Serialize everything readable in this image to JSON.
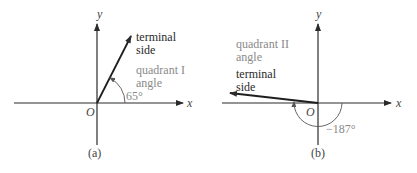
{
  "panel_a": {
    "caption": "(a)",
    "x_label": "x",
    "y_label": "y",
    "origin_label": "O",
    "terminal_label_line1": "terminal",
    "terminal_label_line2": "side",
    "quadrant_label_line1": "quadrant I",
    "quadrant_label_line2": "angle",
    "angle_label": "65°",
    "angle_degrees": 65
  },
  "panel_b": {
    "caption": "(b)",
    "x_label": "x",
    "y_label": "y",
    "origin_label": "O",
    "terminal_label_line1": "terminal",
    "terminal_label_line2": "side",
    "quadrant_label_line1": "quadrant II",
    "quadrant_label_line2": "angle",
    "angle_label": "−187°",
    "angle_degrees": -187
  },
  "colors": {
    "axis": "#2a2a2a",
    "terminal": "#1e1e1e",
    "arc": "#555555",
    "gray_text": "#8a8a8a"
  }
}
